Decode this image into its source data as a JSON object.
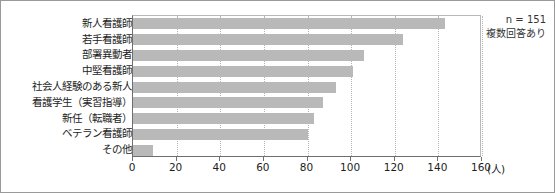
{
  "annotation": {
    "sample_size": "n = 151",
    "note": "複数回答あり"
  },
  "axis": {
    "unit_label": "(人)",
    "ticks": [
      "0",
      "20",
      "40",
      "60",
      "80",
      "100",
      "120",
      "140",
      "160"
    ]
  },
  "chart_data": {
    "type": "bar",
    "orientation": "horizontal",
    "title": "",
    "xlabel": "(人)",
    "ylabel": "",
    "xlim": [
      0,
      160
    ],
    "xticks": [
      0,
      20,
      40,
      60,
      80,
      100,
      120,
      140,
      160
    ],
    "grid": true,
    "legend": false,
    "bar_color": "#b9b9b9",
    "annotations": [
      "n = 151",
      "複数回答あり"
    ],
    "categories": [
      "新人看護師",
      "若手看護師",
      "部署異動者",
      "中堅看護師",
      "社会人経験のある新人",
      "看護学生（実習指導）",
      "新任（転職者）",
      "ベテラン看護師",
      "その他"
    ],
    "values": [
      143,
      124,
      106,
      101,
      93,
      87,
      83,
      80,
      9
    ]
  }
}
